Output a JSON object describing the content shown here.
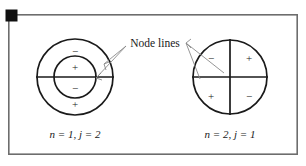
{
  "figure": {
    "background_color": "#ffffff",
    "frame": {
      "stroke_color": "#6d6d6d",
      "x": 8,
      "y": 14,
      "width": 290,
      "height": 141
    },
    "corner_marker": {
      "name": "black-square-marker",
      "color": "#111111",
      "x": 6,
      "y": 10,
      "size": 11
    },
    "annotation": {
      "text": "Node lines",
      "x": 155,
      "y": 44
    },
    "diagrams": [
      {
        "id": "left",
        "label": "n = 1, j = 2",
        "label_parts": {
          "n_var": "n",
          "n_value": "= 1,",
          "j_var": "j",
          "j_value": "= 2"
        },
        "center_x": 75,
        "center_y": 77,
        "outer_radius": 38,
        "inner_radius": 21,
        "circle_count": 2,
        "node_lines": [
          "horizontal"
        ],
        "regions": [
          {
            "sign": "−",
            "x": 75,
            "y": 51
          },
          {
            "sign": "+",
            "x": 75,
            "y": 68
          },
          {
            "sign": "−",
            "x": 75,
            "y": 88
          },
          {
            "sign": "+",
            "x": 75,
            "y": 105
          }
        ],
        "label_x": 75,
        "label_y": 135
      },
      {
        "id": "right",
        "label": "n = 2, j = 1",
        "label_parts": {
          "n_var": "n",
          "n_value": "= 2,",
          "j_var": "j",
          "j_value": "= 1"
        },
        "center_x": 230,
        "center_y": 77,
        "outer_radius": 37,
        "inner_radius": 0,
        "circle_count": 1,
        "node_lines": [
          "horizontal",
          "vertical"
        ],
        "regions": [
          {
            "sign": "−",
            "x": 211,
            "y": 58
          },
          {
            "sign": "+",
            "x": 249,
            "y": 58
          },
          {
            "sign": "+",
            "x": 211,
            "y": 96
          },
          {
            "sign": "−",
            "x": 249,
            "y": 96
          }
        ],
        "label_x": 230,
        "label_y": 135
      }
    ],
    "leader_lines": [
      {
        "name": "leader-left-outer",
        "x1": 126,
        "y1": 46,
        "x2": 96,
        "y2": 78
      },
      {
        "name": "leader-left-inner",
        "x1": 126,
        "y1": 46,
        "x2": 104,
        "y2": 65
      },
      {
        "name": "leader-right-vertical",
        "x1": 186,
        "y1": 43,
        "x2": 224,
        "y2": 73
      },
      {
        "name": "leader-right-horizontal",
        "x1": 186,
        "y1": 43,
        "x2": 200,
        "y2": 79
      }
    ]
  }
}
